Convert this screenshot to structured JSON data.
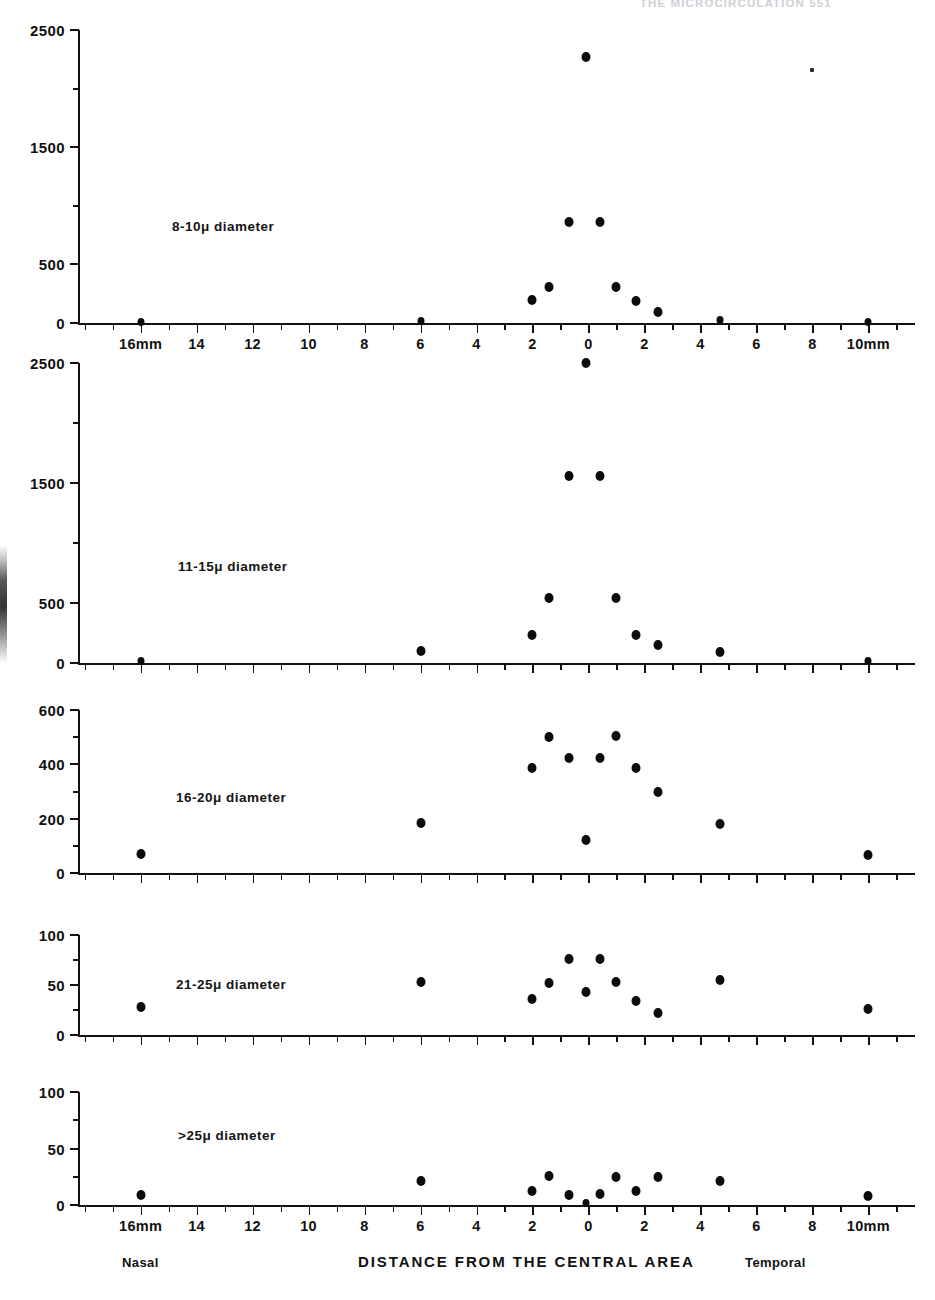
{
  "page": {
    "running_head": "THE MICROCIRCULATION  551",
    "axis_title": "DISTANCE FROM THE CENTRAL AREA",
    "side_label_left": "Nasal",
    "side_label_right": "Temporal",
    "ink_color": "#0b0b0b",
    "background": "#ffffff"
  },
  "x_axis": {
    "label": "DISTANCE FROM THE CENTRAL AREA",
    "tick_labels": [
      "16mm",
      "14",
      "12",
      "10",
      "8",
      "6",
      "4",
      "2",
      "0",
      "2",
      "4",
      "6",
      "8",
      "10mm"
    ],
    "tick_values": [
      -16,
      -14,
      -12,
      -10,
      -8,
      -6,
      -4,
      -2,
      0,
      2,
      4,
      6,
      8,
      10
    ],
    "minor_tick_step": 1,
    "range": [
      -18.2,
      11.2
    ],
    "units": "mm"
  },
  "chart_data": [
    {
      "type": "scatter",
      "title": "8-10μ diameter",
      "xlabel": "DISTANCE FROM THE CENTRAL AREA",
      "ylabel": "",
      "ylim": [
        0,
        2500
      ],
      "ytick_labels": [
        "0",
        "500",
        "1500",
        "2500"
      ],
      "ytick_values": [
        0,
        500,
        1500,
        2500
      ],
      "yminor_values": [
        1000,
        2000
      ],
      "grid": false,
      "legend": "none",
      "points": [
        {
          "x": -16.0,
          "y": 10
        },
        {
          "x": -6.0,
          "y": 15
        },
        {
          "x": -2.0,
          "y": 195
        },
        {
          "x": -1.4,
          "y": 310
        },
        {
          "x": -0.7,
          "y": 860
        },
        {
          "x": -0.1,
          "y": 2270
        },
        {
          "x": 0.4,
          "y": 860
        },
        {
          "x": 1.0,
          "y": 310
        },
        {
          "x": 1.7,
          "y": 190
        },
        {
          "x": 2.5,
          "y": 95
        },
        {
          "x": 4.7,
          "y": 25
        },
        {
          "x": 10.0,
          "y": 12
        }
      ],
      "artifact_specks": [
        {
          "x": 8.0,
          "y": 2155
        }
      ]
    },
    {
      "type": "scatter",
      "title": "11-15μ diameter",
      "xlabel": "DISTANCE FROM THE CENTRAL AREA",
      "ylabel": "",
      "ylim": [
        0,
        2500
      ],
      "ytick_labels": [
        "0",
        "500",
        "1500",
        "2500"
      ],
      "ytick_values": [
        0,
        500,
        1500,
        2500
      ],
      "yminor_values": [
        1000,
        2000
      ],
      "grid": false,
      "legend": "none",
      "points": [
        {
          "x": -16.0,
          "y": 20
        },
        {
          "x": -6.0,
          "y": 100
        },
        {
          "x": -2.0,
          "y": 230
        },
        {
          "x": -1.4,
          "y": 540
        },
        {
          "x": -0.7,
          "y": 1560
        },
        {
          "x": -0.1,
          "y": 2510
        },
        {
          "x": 0.4,
          "y": 1560
        },
        {
          "x": 1.0,
          "y": 540
        },
        {
          "x": 1.7,
          "y": 230
        },
        {
          "x": 2.5,
          "y": 150
        },
        {
          "x": 4.7,
          "y": 90
        },
        {
          "x": 10.0,
          "y": 15
        }
      ],
      "artifact_specks": []
    },
    {
      "type": "scatter",
      "title": "16-20μ diameter",
      "xlabel": "DISTANCE FROM THE CENTRAL AREA",
      "ylabel": "",
      "ylim": [
        0,
        600
      ],
      "ytick_labels": [
        "0",
        "200",
        "400",
        "600"
      ],
      "ytick_values": [
        0,
        200,
        400,
        600
      ],
      "yminor_values": [
        100,
        300,
        500
      ],
      "grid": false,
      "legend": "none",
      "points": [
        {
          "x": -16.0,
          "y": 70
        },
        {
          "x": -6.0,
          "y": 185
        },
        {
          "x": -2.0,
          "y": 385
        },
        {
          "x": -1.4,
          "y": 500
        },
        {
          "x": -0.7,
          "y": 425
        },
        {
          "x": -0.1,
          "y": 120
        },
        {
          "x": 0.4,
          "y": 425
        },
        {
          "x": 1.0,
          "y": 505
        },
        {
          "x": 1.7,
          "y": 385
        },
        {
          "x": 2.5,
          "y": 300
        },
        {
          "x": 4.7,
          "y": 180
        },
        {
          "x": 10.0,
          "y": 65
        }
      ],
      "artifact_specks": []
    },
    {
      "type": "scatter",
      "title": "21-25μ diameter",
      "xlabel": "DISTANCE FROM THE CENTRAL AREA",
      "ylabel": "",
      "ylim": [
        0,
        100
      ],
      "ytick_labels": [
        "0",
        "50",
        "100"
      ],
      "ytick_values": [
        0,
        50,
        100
      ],
      "yminor_values": [
        25,
        75
      ],
      "grid": false,
      "legend": "none",
      "points": [
        {
          "x": -16.0,
          "y": 28
        },
        {
          "x": -6.0,
          "y": 53
        },
        {
          "x": -2.0,
          "y": 36
        },
        {
          "x": -1.4,
          "y": 52
        },
        {
          "x": -0.7,
          "y": 76
        },
        {
          "x": -0.1,
          "y": 43
        },
        {
          "x": 0.4,
          "y": 76
        },
        {
          "x": 1.0,
          "y": 53
        },
        {
          "x": 1.7,
          "y": 34
        },
        {
          "x": 2.5,
          "y": 22
        },
        {
          "x": 4.7,
          "y": 55
        },
        {
          "x": 10.0,
          "y": 26
        }
      ],
      "artifact_specks": []
    },
    {
      "type": "scatter",
      "title": ">25μ diameter",
      "xlabel": "DISTANCE FROM THE CENTRAL AREA",
      "ylabel": "",
      "ylim": [
        0,
        100
      ],
      "ytick_labels": [
        "0",
        "50",
        "100"
      ],
      "ytick_values": [
        0,
        50,
        100
      ],
      "yminor_values": [
        25,
        75
      ],
      "grid": false,
      "legend": "none",
      "points": [
        {
          "x": -16.0,
          "y": 9
        },
        {
          "x": -6.0,
          "y": 21
        },
        {
          "x": -2.0,
          "y": 12
        },
        {
          "x": -1.4,
          "y": 26
        },
        {
          "x": -0.7,
          "y": 9
        },
        {
          "x": -0.1,
          "y": 2
        },
        {
          "x": 0.4,
          "y": 10
        },
        {
          "x": 1.0,
          "y": 25
        },
        {
          "x": 1.7,
          "y": 12
        },
        {
          "x": 2.5,
          "y": 25
        },
        {
          "x": 4.7,
          "y": 21
        },
        {
          "x": 10.0,
          "y": 8
        }
      ],
      "artifact_specks": []
    }
  ]
}
